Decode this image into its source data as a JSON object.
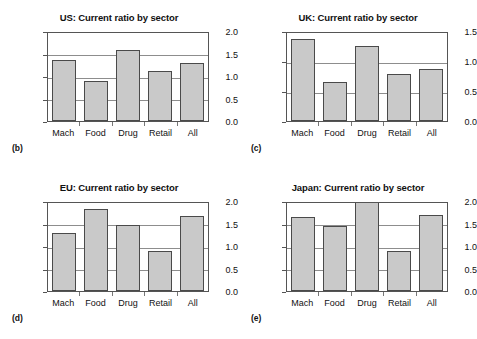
{
  "figure": {
    "categories": [
      "Mach",
      "Food",
      "Drug",
      "Retail",
      "All"
    ],
    "panels": [
      {
        "letter": "(b)",
        "title": "US: Current ratio by sector",
        "ylim": [
          0.0,
          2.0
        ],
        "yticks": [
          "0.0",
          "0.5",
          "1.0",
          "1.5",
          "2.0"
        ],
        "values": [
          1.35,
          0.88,
          1.57,
          1.12,
          1.28
        ]
      },
      {
        "letter": "(c)",
        "title": "UK: Current ratio by sector",
        "ylim": [
          0.0,
          1.5
        ],
        "yticks": [
          "0.0",
          "0.5",
          "1.0",
          "1.5"
        ],
        "values": [
          1.37,
          0.65,
          1.25,
          0.78,
          0.86
        ]
      },
      {
        "letter": "(d)",
        "title": "EU: Current ratio by sector",
        "ylim": [
          0.0,
          2.0
        ],
        "yticks": [
          "0.0",
          "0.5",
          "1.0",
          "1.5",
          "2.0"
        ],
        "values": [
          1.3,
          1.83,
          1.47,
          0.9,
          1.66
        ]
      },
      {
        "letter": "(e)",
        "title": "Japan: Current ratio by sector",
        "ylim": [
          0.0,
          2.0
        ],
        "yticks": [
          "0.0",
          "0.5",
          "1.0",
          "1.5",
          "2.0"
        ],
        "values": [
          1.64,
          1.45,
          2.25,
          0.88,
          1.7
        ]
      }
    ]
  },
  "chart_data": [
    {
      "type": "bar",
      "title": "US: Current ratio by sector",
      "panel_label": "(b)",
      "categories": [
        "Mach",
        "Food",
        "Drug",
        "Retail",
        "All"
      ],
      "values": [
        1.35,
        0.88,
        1.57,
        1.12,
        1.28
      ],
      "xlabel": "",
      "ylabel": "",
      "ylim": [
        0.0,
        2.0
      ],
      "yticks": [
        0.0,
        0.5,
        1.0,
        1.5,
        2.0
      ],
      "grid": true,
      "legend": null,
      "bar_color": "#c9c9c9",
      "bar_edge_color": "#4a4a4a"
    },
    {
      "type": "bar",
      "title": "UK: Current ratio by sector",
      "panel_label": "(c)",
      "categories": [
        "Mach",
        "Food",
        "Drug",
        "Retail",
        "All"
      ],
      "values": [
        1.37,
        0.65,
        1.25,
        0.78,
        0.86
      ],
      "xlabel": "",
      "ylabel": "",
      "ylim": [
        0.0,
        1.5
      ],
      "yticks": [
        0.0,
        0.5,
        1.0,
        1.5
      ],
      "grid": true,
      "legend": null,
      "bar_color": "#c9c9c9",
      "bar_edge_color": "#4a4a4a"
    },
    {
      "type": "bar",
      "title": "EU: Current ratio by sector",
      "panel_label": "(d)",
      "categories": [
        "Mach",
        "Food",
        "Drug",
        "Retail",
        "All"
      ],
      "values": [
        1.3,
        1.83,
        1.47,
        0.9,
        1.66
      ],
      "xlabel": "",
      "ylabel": "",
      "ylim": [
        0.0,
        2.0
      ],
      "yticks": [
        0.0,
        0.5,
        1.0,
        1.5,
        2.0
      ],
      "grid": true,
      "legend": null,
      "bar_color": "#c9c9c9",
      "bar_edge_color": "#4a4a4a"
    },
    {
      "type": "bar",
      "title": "Japan: Current ratio by sector",
      "panel_label": "(e)",
      "categories": [
        "Mach",
        "Food",
        "Drug",
        "Retail",
        "All"
      ],
      "values": [
        1.64,
        1.45,
        2.25,
        0.88,
        1.7
      ],
      "notes": "Drug bar exceeds the 2.0 axis maximum and is clipped at the top of the plot frame.",
      "xlabel": "",
      "ylabel": "",
      "ylim": [
        0.0,
        2.0
      ],
      "yticks": [
        0.0,
        0.5,
        1.0,
        1.5,
        2.0
      ],
      "grid": true,
      "legend": null,
      "bar_color": "#c9c9c9",
      "bar_edge_color": "#4a4a4a"
    }
  ]
}
